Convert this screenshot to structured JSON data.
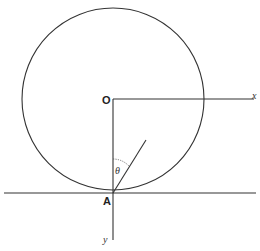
{
  "diagram": {
    "labels": {
      "center": "O",
      "contact_point": "A",
      "x_axis": "x",
      "y_axis": "y",
      "angle": "θ"
    },
    "colors": {
      "stroke": "#333333",
      "background": "#ffffff"
    }
  }
}
